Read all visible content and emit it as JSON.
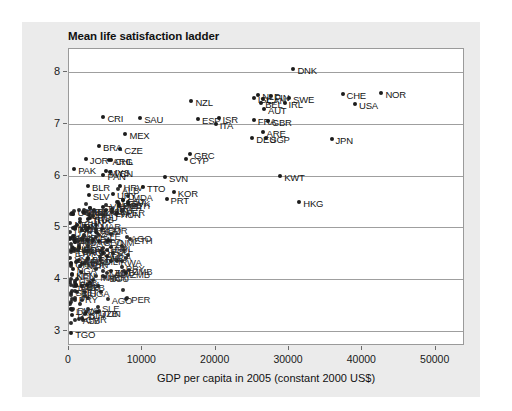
{
  "chart_data": {
    "type": "scatter",
    "title": "Mean life satisfaction ladder",
    "xlabel": "GDP per capita in 2005 (constant 2000 US$)",
    "ylabel": "",
    "xlim": [
      0,
      54000
    ],
    "ylim": [
      2.7,
      8.45
    ],
    "xticks": [
      0,
      10000,
      20000,
      30000,
      40000,
      50000
    ],
    "xtick_labels": [
      "0",
      "10000",
      "20000",
      "30000",
      "40000",
      "50000"
    ],
    "yticks": [
      3,
      4,
      5,
      6,
      7,
      8
    ],
    "ytick_labels": [
      "3",
      "4",
      "5",
      "6",
      "7",
      "8"
    ],
    "grid": "horizontal",
    "legend": "none",
    "marker_color": "#1c1c1c",
    "panel_color": "#ebebeb",
    "plot_background": "#ffffff",
    "points": [
      {
        "label": "DNK",
        "x": 30600,
        "y": 8.06
      },
      {
        "label": "NOR",
        "x": 42600,
        "y": 7.6
      },
      {
        "label": "CHE",
        "x": 37300,
        "y": 7.58
      },
      {
        "label": "NLD",
        "x": 25800,
        "y": 7.56
      },
      {
        "label": "FIN",
        "x": 27500,
        "y": 7.54
      },
      {
        "label": "SWE",
        "x": 30000,
        "y": 7.51
      },
      {
        "label": "ISL",
        "x": 25200,
        "y": 7.5
      },
      {
        "label": "CAN",
        "x": 26400,
        "y": 7.49
      },
      {
        "label": "NZL",
        "x": 16700,
        "y": 7.44
      },
      {
        "label": "BEL",
        "x": 26200,
        "y": 7.41
      },
      {
        "label": "IRL",
        "x": 29400,
        "y": 7.4
      },
      {
        "label": "USA",
        "x": 39000,
        "y": 7.38
      },
      {
        "label": "AUT",
        "x": 26600,
        "y": 7.29
      },
      {
        "label": "CRI",
        "x": 4700,
        "y": 7.14
      },
      {
        "label": "SAU",
        "x": 9700,
        "y": 7.12
      },
      {
        "label": "ESP",
        "x": 17600,
        "y": 7.1
      },
      {
        "label": "ISR",
        "x": 20400,
        "y": 7.12
      },
      {
        "label": "FRA",
        "x": 25200,
        "y": 7.07
      },
      {
        "label": "GBR",
        "x": 27100,
        "y": 7.05
      },
      {
        "label": "ITA",
        "x": 20000,
        "y": 7.0
      },
      {
        "label": "ARE",
        "x": 26400,
        "y": 6.85
      },
      {
        "label": "MEX",
        "x": 7700,
        "y": 6.8
      },
      {
        "label": "DEU",
        "x": 25000,
        "y": 6.72
      },
      {
        "label": "SGP",
        "x": 26900,
        "y": 6.72
      },
      {
        "label": "JPN",
        "x": 35800,
        "y": 6.7
      },
      {
        "label": "BRA",
        "x": 4100,
        "y": 6.57
      },
      {
        "label": "CZE",
        "x": 7000,
        "y": 6.52
      },
      {
        "label": "GRC",
        "x": 16500,
        "y": 6.42
      },
      {
        "label": "CYP",
        "x": 15900,
        "y": 6.32
      },
      {
        "label": "JOR",
        "x": 2300,
        "y": 6.33
      },
      {
        "label": "CHL",
        "x": 5700,
        "y": 6.3
      },
      {
        "label": "ARG",
        "x": 5400,
        "y": 6.3
      },
      {
        "label": "PAK",
        "x": 700,
        "y": 6.12
      },
      {
        "label": "MYS",
        "x": 5000,
        "y": 6.09
      },
      {
        "label": "VEN",
        "x": 5600,
        "y": 6.06
      },
      {
        "label": "PAN",
        "x": 4700,
        "y": 6.01
      },
      {
        "label": "SVN",
        "x": 13100,
        "y": 5.98
      },
      {
        "label": "KWT",
        "x": 28800,
        "y": 6.0
      },
      {
        "label": "BLR",
        "x": 2600,
        "y": 5.8
      },
      {
        "label": "HRV",
        "x": 6900,
        "y": 5.79
      },
      {
        "label": "TTO",
        "x": 10100,
        "y": 5.78
      },
      {
        "label": "KOR",
        "x": 14300,
        "y": 5.68
      },
      {
        "label": "URY",
        "x": 6000,
        "y": 5.65
      },
      {
        "label": "SLV",
        "x": 2700,
        "y": 5.62
      },
      {
        "label": "PRT",
        "x": 13300,
        "y": 5.55
      },
      {
        "label": "EST",
        "x": 7400,
        "y": 5.52
      },
      {
        "label": "SVK",
        "x": 8000,
        "y": 5.48
      },
      {
        "label": "HKG",
        "x": 31400,
        "y": 5.48
      },
      {
        "label": "POL",
        "x": 6800,
        "y": 5.45
      },
      {
        "label": "TUR",
        "x": 4600,
        "y": 5.4
      },
      {
        "label": "LTU",
        "x": 5900,
        "y": 5.35
      },
      {
        "label": "LVA",
        "x": 5800,
        "y": 5.3
      },
      {
        "label": "HUN",
        "x": 6500,
        "y": 5.27
      },
      {
        "label": "ROU",
        "x": 3300,
        "y": 5.22
      },
      {
        "label": "RUS",
        "x": 2900,
        "y": 5.18
      },
      {
        "label": "THA",
        "x": 2600,
        "y": 5.15
      },
      {
        "label": "CHN",
        "x": 1500,
        "y": 5.1
      },
      {
        "label": "IDN",
        "x": 1100,
        "y": 5.05
      },
      {
        "label": "IND",
        "x": 600,
        "y": 4.98
      },
      {
        "label": "BGR",
        "x": 2600,
        "y": 4.4
      },
      {
        "label": "UKR",
        "x": 1200,
        "y": 4.55
      },
      {
        "label": "ZAF",
        "x": 3700,
        "y": 4.9
      },
      {
        "label": "EGY",
        "x": 1400,
        "y": 4.6
      },
      {
        "label": "KEN",
        "x": 450,
        "y": 4.1
      },
      {
        "label": "NGA",
        "x": 500,
        "y": 4.2
      },
      {
        "label": "GHA",
        "x": 320,
        "y": 4.3
      },
      {
        "label": "TCD",
        "x": 380,
        "y": 3.3
      },
      {
        "label": "TGO",
        "x": 300,
        "y": 2.95
      }
    ],
    "dense_cluster_note": "Large overlapping cluster of low-GDP countries between x=0 and x=9000, y=3.0 to y=6.2"
  }
}
